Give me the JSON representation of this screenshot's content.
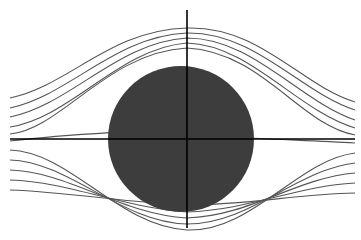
{
  "diagram": {
    "background": "#ffffff",
    "cylinder": {
      "cx": 181,
      "cy": 139,
      "rx": 73,
      "ry": 73,
      "fill": "#3d3d3d"
    },
    "axes": {
      "horizontal": {
        "x1": 10,
        "y1": 139,
        "x2": 355,
        "y2": 139
      },
      "vertical": {
        "x1": 187,
        "y1": 10,
        "x2": 187,
        "y2": 228
      },
      "color": "#000000"
    },
    "streamline_color": "#555555",
    "streamlines": [
      "M10,98 C70,85 110,30 187,28 C260,26 300,85 355,102",
      "M10,108 C70,95 115,36 187,33 C255,32 300,92 355,110",
      "M10,117 C70,105 118,42 187,38 C252,38 298,100 355,120",
      "M10,127 C70,118 120,48 187,43 C250,45 296,110 355,128",
      "M10,134 C60,130 108,52 187,48 C262,52 300,125 355,135",
      "M10,141 C60,135 105,133 120,132",
      "M250,138 C290,140 320,141 355,143",
      "M10,150 C70,152 118,226 187,230 C252,232 298,160 355,153",
      "M10,160 C70,162 120,222 187,224 C250,224 296,170 355,163",
      "M10,170 C70,172 120,214 187,218 C250,216 296,178 355,173",
      "M10,180 C70,182 124,208 187,212 C250,210 296,186 355,183",
      "M10,190 C70,192 128,203 187,205 C250,205 296,194 355,193"
    ]
  }
}
